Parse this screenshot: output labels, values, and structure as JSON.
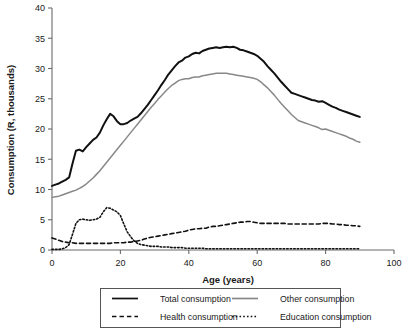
{
  "chart_data": {
    "type": "line",
    "title": "",
    "xlabel": "Age (years)",
    "ylabel": "Consumption (R, thousands)",
    "xlim": [
      0,
      100
    ],
    "ylim": [
      0,
      40
    ],
    "xticks": [
      0,
      20,
      40,
      60,
      80,
      100
    ],
    "yticks": [
      0,
      5,
      10,
      15,
      20,
      25,
      30,
      35,
      40
    ],
    "grid": false,
    "legend_position": "below-axes",
    "x": [
      0,
      1,
      2,
      3,
      4,
      5,
      6,
      7,
      8,
      9,
      10,
      11,
      12,
      13,
      14,
      15,
      16,
      17,
      18,
      19,
      20,
      21,
      22,
      23,
      24,
      25,
      26,
      27,
      28,
      29,
      30,
      31,
      32,
      33,
      34,
      35,
      36,
      37,
      38,
      39,
      40,
      41,
      42,
      43,
      44,
      45,
      46,
      47,
      48,
      49,
      50,
      51,
      52,
      53,
      54,
      55,
      56,
      57,
      58,
      59,
      60,
      61,
      62,
      63,
      64,
      65,
      66,
      67,
      68,
      69,
      70,
      71,
      72,
      73,
      74,
      75,
      76,
      77,
      78,
      79,
      80,
      81,
      82,
      83,
      84,
      85,
      86,
      87,
      88,
      89,
      90
    ],
    "series": [
      {
        "name": "Total consumption",
        "color": "#111111",
        "style": "solid",
        "width": 2.0,
        "values": [
          10.6,
          10.8,
          11.0,
          11.3,
          11.6,
          12.0,
          14.3,
          16.4,
          16.6,
          16.3,
          17.0,
          17.6,
          18.2,
          18.6,
          19.4,
          20.6,
          21.6,
          22.5,
          22.1,
          21.3,
          20.8,
          20.8,
          21.0,
          21.4,
          21.7,
          22.0,
          22.6,
          23.3,
          24.0,
          24.8,
          25.6,
          26.4,
          27.3,
          28.1,
          29.0,
          29.7,
          30.4,
          31.0,
          31.3,
          31.8,
          32.0,
          32.4,
          32.6,
          32.5,
          32.9,
          33.1,
          33.3,
          33.4,
          33.5,
          33.4,
          33.5,
          33.6,
          33.5,
          33.6,
          33.4,
          33.1,
          33.0,
          32.8,
          32.6,
          32.4,
          32.1,
          31.6,
          31.1,
          30.4,
          29.8,
          29.2,
          28.5,
          27.8,
          27.2,
          26.6,
          26.0,
          25.8,
          25.6,
          25.4,
          25.2,
          25.0,
          24.8,
          24.7,
          24.5,
          24.6,
          24.3,
          24.0,
          23.7,
          23.5,
          23.2,
          23.0,
          22.8,
          22.6,
          22.4,
          22.2,
          22.0
        ]
      },
      {
        "name": "Other consumption",
        "color": "#888888",
        "style": "solid",
        "width": 1.5,
        "values": [
          8.7,
          8.8,
          8.9,
          9.1,
          9.3,
          9.5,
          9.7,
          9.9,
          10.2,
          10.5,
          10.9,
          11.4,
          11.9,
          12.5,
          13.1,
          13.8,
          14.5,
          15.2,
          15.9,
          16.6,
          17.3,
          18.0,
          18.7,
          19.4,
          20.1,
          20.8,
          21.5,
          22.2,
          22.9,
          23.6,
          24.2,
          24.9,
          25.5,
          26.1,
          26.7,
          27.2,
          27.6,
          28.0,
          28.2,
          28.3,
          28.3,
          28.5,
          28.6,
          28.6,
          28.8,
          28.9,
          29.0,
          29.1,
          29.2,
          29.2,
          29.2,
          29.2,
          29.1,
          29.0,
          28.9,
          28.8,
          28.7,
          28.6,
          28.5,
          28.4,
          28.2,
          27.8,
          27.3,
          26.8,
          26.2,
          25.6,
          24.9,
          24.2,
          23.6,
          23.0,
          22.4,
          21.9,
          21.4,
          21.2,
          21.0,
          20.8,
          20.6,
          20.4,
          20.2,
          19.9,
          20.0,
          19.8,
          19.6,
          19.4,
          19.2,
          19.0,
          18.8,
          18.5,
          18.3,
          18.0,
          17.8
        ]
      },
      {
        "name": "Health consumption",
        "color": "#111111",
        "style": "dashed",
        "width": 1.6,
        "values": [
          2.0,
          1.8,
          1.6,
          1.4,
          1.3,
          1.2,
          1.2,
          1.1,
          1.1,
          1.1,
          1.1,
          1.1,
          1.1,
          1.1,
          1.1,
          1.1,
          1.1,
          1.1,
          1.2,
          1.2,
          1.2,
          1.2,
          1.3,
          1.3,
          1.4,
          1.5,
          1.6,
          1.8,
          2.0,
          2.1,
          2.2,
          2.3,
          2.4,
          2.5,
          2.6,
          2.7,
          2.8,
          2.9,
          3.0,
          3.1,
          3.3,
          3.4,
          3.5,
          3.5,
          3.6,
          3.6,
          3.8,
          3.9,
          3.9,
          4.0,
          4.1,
          4.2,
          4.3,
          4.4,
          4.5,
          4.6,
          4.6,
          4.7,
          4.7,
          4.6,
          4.5,
          4.4,
          4.4,
          4.4,
          4.4,
          4.4,
          4.4,
          4.4,
          4.4,
          4.3,
          4.3,
          4.3,
          4.3,
          4.3,
          4.3,
          4.3,
          4.3,
          4.3,
          4.3,
          4.4,
          4.4,
          4.4,
          4.3,
          4.3,
          4.2,
          4.2,
          4.1,
          4.1,
          4.0,
          4.0,
          3.9
        ]
      },
      {
        "name": "Education consumption",
        "color": "#111111",
        "style": "dotted",
        "width": 1.6,
        "values": [
          0.1,
          0.1,
          0.1,
          0.2,
          0.4,
          0.9,
          2.6,
          4.4,
          5.0,
          5.1,
          5.0,
          4.9,
          5.0,
          5.1,
          5.4,
          6.3,
          7.0,
          6.9,
          6.6,
          6.3,
          5.7,
          4.3,
          3.0,
          2.2,
          1.5,
          1.1,
          0.9,
          0.8,
          0.7,
          0.6,
          0.6,
          0.6,
          0.5,
          0.5,
          0.5,
          0.4,
          0.4,
          0.4,
          0.4,
          0.3,
          0.3,
          0.3,
          0.3,
          0.3,
          0.3,
          0.2,
          0.2,
          0.2,
          0.2,
          0.2,
          0.2,
          0.2,
          0.2,
          0.2,
          0.2,
          0.2,
          0.2,
          0.2,
          0.2,
          0.2,
          0.2,
          0.2,
          0.2,
          0.2,
          0.2,
          0.2,
          0.2,
          0.2,
          0.2,
          0.2,
          0.2,
          0.2,
          0.2,
          0.2,
          0.2,
          0.2,
          0.2,
          0.2,
          0.2,
          0.2,
          0.2,
          0.2,
          0.2,
          0.2,
          0.2,
          0.2,
          0.2,
          0.2,
          0.2,
          0.2,
          0.2
        ]
      }
    ]
  },
  "legend": {
    "items": [
      {
        "label": "Total consumption",
        "style": "solid",
        "color": "#111111"
      },
      {
        "label": "Other consumption",
        "style": "solid",
        "color": "#888888"
      },
      {
        "label": "Health consumption",
        "style": "dashed",
        "color": "#111111"
      },
      {
        "label": "Education consumption",
        "style": "dotted",
        "color": "#111111"
      }
    ]
  }
}
